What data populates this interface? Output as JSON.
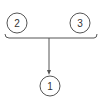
{
  "diagram": {
    "type": "merge-flow",
    "colors": {
      "stroke": "#555555",
      "text": "#333333",
      "background": "#ffffff"
    },
    "nodes": [
      {
        "id": "node-2",
        "label": "2",
        "cx": 17,
        "cy": 23,
        "r": 10
      },
      {
        "id": "node-3",
        "label": "3",
        "cx": 80,
        "cy": 23,
        "r": 10
      },
      {
        "id": "node-1",
        "label": "1",
        "cx": 50,
        "cy": 86,
        "r": 10
      }
    ],
    "edges": [
      {
        "from": [
          "node-2",
          "node-3"
        ],
        "to": "node-1",
        "style": "brace-merge-arrow"
      }
    ]
  }
}
